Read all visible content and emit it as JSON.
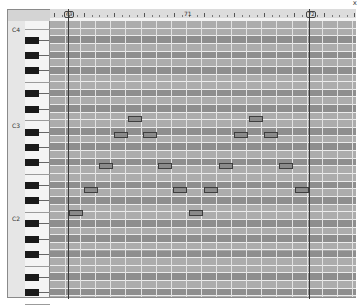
{
  "window": {
    "close_glyph": "x"
  },
  "ruler": {
    "markers": [
      {
        "label": "69",
        "x": 67,
        "boxed": true
      },
      {
        "label": "71",
        "x": 187,
        "boxed": false
      },
      {
        "label": "72",
        "x": 309,
        "boxed": true
      }
    ]
  },
  "keyboard": {
    "octave_labels": [
      {
        "label": "C4",
        "y": 26
      },
      {
        "label": "C3",
        "y": 122
      },
      {
        "label": "C2",
        "y": 215
      }
    ]
  },
  "colors": {
    "note_fill": "#8a8a8a",
    "note_border": "#3e3e3e",
    "row_black": "#8e8e8e",
    "row_white": "#acacac",
    "grid_line": "#ececec"
  },
  "playback": {
    "loop_start_x": 68,
    "loop_end_x": 309
  },
  "notes": [
    {
      "x": 69,
      "y": 210,
      "w": 14
    },
    {
      "x": 84,
      "y": 187,
      "w": 14
    },
    {
      "x": 99,
      "y": 163,
      "w": 14
    },
    {
      "x": 114,
      "y": 132,
      "w": 14
    },
    {
      "x": 128,
      "y": 116,
      "w": 14
    },
    {
      "x": 143,
      "y": 132,
      "w": 14
    },
    {
      "x": 158,
      "y": 163,
      "w": 14
    },
    {
      "x": 173,
      "y": 187,
      "w": 14
    },
    {
      "x": 189,
      "y": 210,
      "w": 14
    },
    {
      "x": 204,
      "y": 187,
      "w": 14
    },
    {
      "x": 219,
      "y": 163,
      "w": 14
    },
    {
      "x": 234,
      "y": 132,
      "w": 14
    },
    {
      "x": 249,
      "y": 116,
      "w": 14
    },
    {
      "x": 264,
      "y": 132,
      "w": 14
    },
    {
      "x": 279,
      "y": 163,
      "w": 14
    },
    {
      "x": 295,
      "y": 187,
      "w": 14
    }
  ]
}
